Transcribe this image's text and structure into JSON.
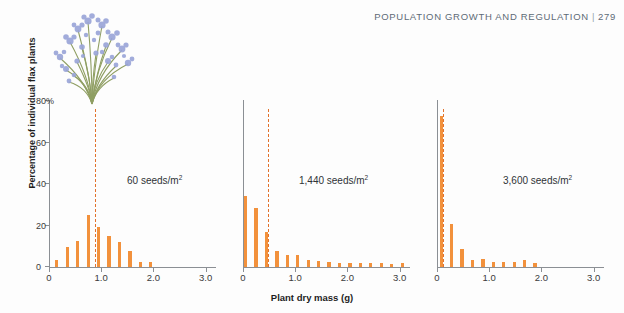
{
  "header": {
    "running_head": "POPULATION GROWTH AND REGULATION",
    "separator": "|",
    "page_number": "279"
  },
  "illustration": {
    "name": "flax-plant-illustration",
    "flower_color": "#9aa5d6",
    "stem_color": "#8a9a5b"
  },
  "colors": {
    "bar": "#f2913c",
    "mean_line": "#e2722b",
    "axis": "#8b8f94",
    "text": "#2f3337",
    "header": "#5d6b77"
  },
  "chart_data": {
    "type": "bar",
    "title": "",
    "xlabel": "Plant dry mass (g)",
    "ylabel": "Percentage of individual flax plants",
    "xlim": [
      0,
      3.2
    ],
    "ylim": [
      0,
      80
    ],
    "xticks": [
      "0",
      "1.0",
      "2.0",
      "3.0"
    ],
    "xtick_values": [
      0,
      1.0,
      2.0,
      3.0
    ],
    "yticks": [
      "0",
      "20",
      "40",
      "60",
      "80%"
    ],
    "ytick_values": [
      0,
      20,
      40,
      60,
      80
    ],
    "grid": false,
    "legend": "none",
    "bin_width": 0.1,
    "panels": [
      {
        "label": "60 seeds/m",
        "label_sup": "2",
        "mean_mass": 0.88,
        "x": [
          0.05,
          0.15,
          0.25,
          0.35,
          0.45,
          0.55,
          0.65,
          0.75,
          0.85,
          0.95,
          1.05,
          1.15,
          1.25,
          1.35,
          1.45,
          1.55,
          1.65,
          1.75,
          1.85,
          1.95
        ],
        "values": [
          0,
          3.5,
          0,
          9.5,
          0,
          12.3,
          0,
          25.0,
          0,
          19.3,
          0,
          14.8,
          0,
          12.0,
          0,
          7.8,
          0,
          2.4,
          0,
          2.2
        ]
      },
      {
        "label": "1,440 seeds/m",
        "label_sup": "2",
        "mean_mass": 0.47,
        "x": [
          0.05,
          0.15,
          0.25,
          0.35,
          0.45,
          0.55,
          0.65,
          0.75,
          0.85,
          0.95,
          1.05,
          1.15,
          1.25,
          1.35,
          1.45,
          1.55,
          1.65,
          1.75,
          1.85,
          1.95,
          2.05,
          2.15,
          2.25,
          2.35,
          2.45,
          2.55,
          2.65,
          2.75,
          2.85,
          2.95,
          3.05
        ],
        "values": [
          34.0,
          0,
          28.5,
          0,
          16.8,
          0,
          7.8,
          0,
          6.0,
          0,
          5.6,
          0,
          3.2,
          0,
          2.8,
          0,
          2.6,
          0,
          2.0,
          0,
          1.8,
          0,
          1.8,
          0,
          1.8,
          0,
          1.8,
          0,
          1.3,
          0,
          1.8
        ]
      },
      {
        "label": "3,600 seeds/m",
        "label_sup": "2",
        "mean_mass": 0.11,
        "x": [
          0.08,
          0.18,
          0.28,
          0.38,
          0.48,
          0.58,
          0.68,
          0.78,
          0.88,
          0.98,
          1.08,
          1.18,
          1.28,
          1.38,
          1.48,
          1.58,
          1.68,
          1.78,
          1.88
        ],
        "values": [
          73.0,
          0,
          20.5,
          0,
          8.5,
          0,
          3.4,
          0,
          3.8,
          0,
          2.3,
          0,
          2.6,
          0,
          2.4,
          0,
          3.6,
          0,
          1.8
        ]
      }
    ]
  }
}
